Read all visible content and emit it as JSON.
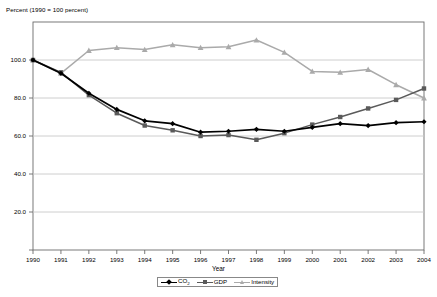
{
  "chart_data": {
    "type": "line",
    "title": "",
    "ylabel": "Percent (1990 = 100 percent)",
    "xlabel": "Year",
    "categories": [
      "1990",
      "1991",
      "1992",
      "1993",
      "1994",
      "1995",
      "1996",
      "1997",
      "1998",
      "1999",
      "2000",
      "2001",
      "2002",
      "2003",
      "2004"
    ],
    "ylim": [
      0,
      120
    ],
    "yticks": [
      "0.0",
      "20.0",
      "40.0",
      "60.0",
      "80.0",
      "100.0",
      "120.0"
    ],
    "ytick_values": [
      0,
      20,
      40,
      60,
      80,
      100,
      120
    ],
    "ytick_visible": [
      "20.0",
      "40.0",
      "60.0",
      "80.0",
      "100.0"
    ],
    "grid": true,
    "legend_position": "bottom",
    "series": [
      {
        "name": "CO2",
        "label_html": "CO<sub>2</sub>",
        "color": "#000000",
        "marker": "diamond",
        "values": [
          100.0,
          93.0,
          82.5,
          74.0,
          68.0,
          66.5,
          62.0,
          62.5,
          63.5,
          62.5,
          64.5,
          66.5,
          65.5,
          67.0,
          67.5
        ]
      },
      {
        "name": "GDP",
        "label_html": "GDP",
        "color": "#5a5a5a",
        "marker": "square",
        "values": [
          100.0,
          93.5,
          81.5,
          72.0,
          65.5,
          63.0,
          60.0,
          60.5,
          58.0,
          61.5,
          66.0,
          70.0,
          74.5,
          79.0,
          85.0
        ]
      },
      {
        "name": "Intensity",
        "label_html": "Intensity",
        "color": "#aaaaaa",
        "marker": "triangle",
        "values": [
          100.0,
          93.0,
          105.0,
          106.5,
          105.5,
          108.0,
          106.5,
          107.0,
          110.5,
          104.0,
          94.0,
          93.5,
          95.0,
          87.0,
          80.0
        ]
      }
    ]
  },
  "legend": {
    "entries": [
      {
        "label": "CO2",
        "color": "#000000",
        "marker": "diamond"
      },
      {
        "label": "GDP",
        "color": "#5a5a5a",
        "marker": "square"
      },
      {
        "label": "Intensity",
        "color": "#aaaaaa",
        "marker": "triangle"
      }
    ]
  },
  "colors": {
    "co2": "#000000",
    "gdp": "#5a5a5a",
    "intensity": "#aaaaaa",
    "grid": "#c8c8c8",
    "axis": "#6b6b6b",
    "background": "#ffffff"
  }
}
